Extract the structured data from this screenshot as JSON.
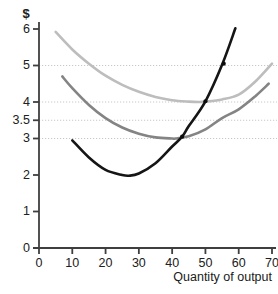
{
  "chart_data": {
    "type": "line",
    "title": "",
    "xlabel": "Quantity of output",
    "ylabel": "$",
    "xlim": [
      0,
      72
    ],
    "ylim": [
      0,
      6.4
    ],
    "xticks": [
      0,
      10,
      20,
      30,
      40,
      50,
      60,
      70
    ],
    "xtick_labels": [
      "0",
      "10",
      "20",
      "30",
      "40",
      "50",
      "60",
      "70"
    ],
    "yticks": [
      0,
      1,
      2,
      3,
      3.5,
      4,
      5,
      6
    ],
    "ytick_labels": [
      "0",
      "1",
      "2",
      "3",
      "3.5",
      "4",
      "5",
      "6"
    ],
    "grid": true,
    "gridlines_y": [
      3,
      3.5,
      4,
      5
    ],
    "legend": "none",
    "colors": {
      "marginal_cost": "#151515",
      "average_variable_cost": "#848484",
      "average_total_cost": "#bdbdbd",
      "axis": "#3f3f3f",
      "gridline": "#c8c8c8",
      "background": "#ffffff"
    },
    "series": [
      {
        "name": "average total cost",
        "color": "#bdbdbd",
        "minimum": {
          "x": 48,
          "y": 4.0
        },
        "x": [
          5,
          10,
          15,
          20,
          25,
          30,
          35,
          40,
          45,
          48,
          50,
          55,
          60,
          65,
          70
        ],
        "y": [
          5.92,
          5.44,
          5.05,
          4.72,
          4.47,
          4.28,
          4.14,
          4.05,
          4.01,
          4.0,
          4.01,
          4.07,
          4.2,
          4.56,
          5.05
        ]
      },
      {
        "name": "average variable cost",
        "color": "#848484",
        "minimum": {
          "x": 41,
          "y": 3.0
        },
        "x": [
          7,
          10,
          15,
          20,
          25,
          30,
          35,
          40,
          41,
          45,
          50,
          55,
          60,
          65,
          69
        ],
        "y": [
          4.7,
          4.38,
          3.92,
          3.56,
          3.3,
          3.13,
          3.03,
          3.0,
          3.0,
          3.06,
          3.25,
          3.56,
          3.8,
          4.16,
          4.5
        ]
      },
      {
        "name": "marginal cost",
        "color": "#151515",
        "minimum": {
          "x": 27,
          "y": 1.98
        },
        "x": [
          10,
          15,
          20,
          25,
          27,
          30,
          35,
          40,
          43,
          45,
          50,
          55,
          59
        ],
        "y": [
          2.95,
          2.48,
          2.14,
          2.0,
          1.98,
          2.04,
          2.32,
          2.78,
          3.05,
          3.34,
          4.02,
          5.02,
          6.02
        ]
      }
    ],
    "points": [
      {
        "label": "",
        "x": 43,
        "y": 3.05,
        "series": "marginal cost"
      },
      {
        "label": "",
        "x": 50,
        "y": 4.02,
        "series": "marginal cost"
      },
      {
        "label": "",
        "x": 55.5,
        "y": 5.05,
        "series": "marginal cost"
      }
    ]
  }
}
